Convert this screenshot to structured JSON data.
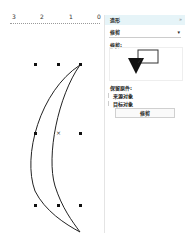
{
  "ruler": {
    "labels": [
      "3",
      "2",
      "1",
      "0"
    ]
  },
  "canvas": {
    "shape": "crescent",
    "selection_center": "×"
  },
  "docker": {
    "title": "造形",
    "close_icon": "»",
    "mode_dropdown": {
      "selected": "修剪",
      "arrow": "▾"
    },
    "section_label": "修剪:",
    "leave_original_label": "保留原件:",
    "options": [
      {
        "label": "来源对象",
        "checked": false
      },
      {
        "label": "目标对象",
        "checked": false
      }
    ],
    "apply_button": "修剪"
  },
  "colors": {
    "header_bg": "#e6f4f8",
    "stroke": "#222222"
  }
}
